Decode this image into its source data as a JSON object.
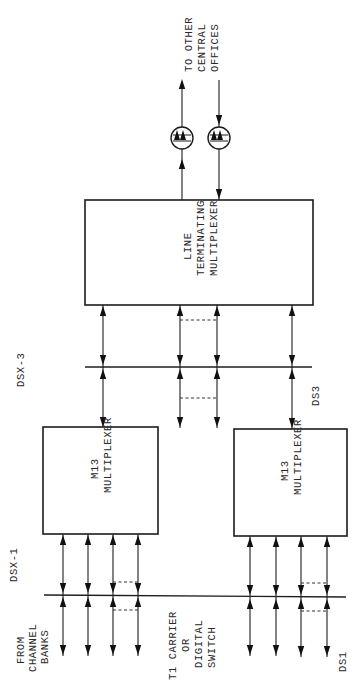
{
  "diagram": {
    "orientation": "rotated-90-ccw",
    "boxes": {
      "line_terminating_mux": [
        "LINE",
        "TERMINATING",
        "MULTIPLEXER"
      ],
      "m13_upper": [
        "M13",
        "MULTIPLEXER"
      ],
      "m13_lower": [
        "M13",
        "MULTIPLEXER"
      ]
    },
    "labels": {
      "to_other_offices": [
        "TO OTHER",
        "CENTRAL",
        "OFFICES"
      ],
      "dsx3": "DSX-3",
      "ds3": "DS3",
      "dsx1": "DSX-1",
      "from_channel_banks": [
        "FROM",
        "CHANNEL",
        "BANKS"
      ],
      "t1_carrier": [
        "T1 CARRIER",
        "OR",
        "DIGITAL",
        "SWITCH"
      ],
      "ds1": "DS1"
    },
    "colors": {
      "ink": "#1c1c1c",
      "paper": "#ffffff"
    }
  }
}
